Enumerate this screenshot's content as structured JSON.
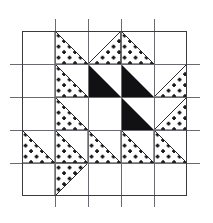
{
  "title": {
    "number": "292.",
    "name": "Fruit Basket"
  },
  "colors": {
    "ink": "#16161a",
    "dark_patch": "#111113",
    "background": "#ffffff",
    "grid_line": "#5d5d62",
    "frame_line": "#3a3a3f",
    "dot_fill": "#1a1a1d"
  },
  "block": {
    "name": "Fruit Basket",
    "grid_rows": 5,
    "grid_cols": 5,
    "cell_size_px": 33,
    "frame": {
      "x": 22,
      "y": 31,
      "width": 165,
      "height": 165
    },
    "guide_line_overhang_px": 12,
    "patch_styles": [
      "plain",
      "dotted",
      "solid-dark"
    ],
    "legend": {
      "plain_label": "plain / white patch",
      "dotted_label": "printed (dotted) patch",
      "dark_label": "solid dark patch"
    },
    "patches": [
      {
        "row": 0,
        "col": 0,
        "shape": "square",
        "fill": "plain"
      },
      {
        "row": 0,
        "col": 1,
        "shape": "triangle",
        "fill": "dotted",
        "corner": "tr"
      },
      {
        "row": 0,
        "col": 2,
        "shape": "triangle",
        "fill": "dotted",
        "corner": "tl"
      },
      {
        "row": 0,
        "col": 3,
        "shape": "triangle",
        "fill": "dotted",
        "corner": "tr"
      },
      {
        "row": 0,
        "col": 4,
        "shape": "square",
        "fill": "plain"
      },
      {
        "row": 1,
        "col": 0,
        "shape": "square",
        "fill": "plain"
      },
      {
        "row": 1,
        "col": 1,
        "shape": "triangle",
        "fill": "dotted",
        "corner": "bl"
      },
      {
        "row": 1,
        "col": 2,
        "shape": "triangle",
        "fill": "solid-dark",
        "corner": "bl"
      },
      {
        "row": 1,
        "col": 3,
        "shape": "triangle",
        "fill": "solid-dark",
        "corner": "bl"
      },
      {
        "row": 1,
        "col": 4,
        "shape": "triangle",
        "fill": "dotted",
        "corner": "tr"
      },
      {
        "row": 2,
        "col": 0,
        "shape": "square",
        "fill": "plain"
      },
      {
        "row": 2,
        "col": 1,
        "shape": "triangle",
        "fill": "dotted",
        "corner": "bl"
      },
      {
        "row": 2,
        "col": 2,
        "shape": "square",
        "fill": "plain"
      },
      {
        "row": 2,
        "col": 3,
        "shape": "triangle",
        "fill": "solid-dark",
        "corner": "br"
      },
      {
        "row": 2,
        "col": 4,
        "shape": "triangle",
        "fill": "dotted",
        "corner": "tr"
      },
      {
        "row": 3,
        "col": 0,
        "shape": "triangle",
        "fill": "dotted",
        "corner": "bl"
      },
      {
        "row": 3,
        "col": 1,
        "shape": "triangle",
        "fill": "dotted",
        "corner": "bl"
      },
      {
        "row": 3,
        "col": 2,
        "shape": "triangle",
        "fill": "dotted",
        "corner": "bl"
      },
      {
        "row": 3,
        "col": 3,
        "shape": "triangle",
        "fill": "dotted",
        "corner": "bl"
      },
      {
        "row": 3,
        "col": 4,
        "shape": "triangle",
        "fill": "dotted",
        "corner": "bl"
      },
      {
        "row": 4,
        "col": 0,
        "shape": "square",
        "fill": "plain"
      },
      {
        "row": 4,
        "col": 1,
        "shape": "triangle",
        "fill": "dotted",
        "corner": "tl"
      },
      {
        "row": 4,
        "col": 2,
        "shape": "square",
        "fill": "plain"
      },
      {
        "row": 4,
        "col": 3,
        "shape": "square",
        "fill": "plain"
      },
      {
        "row": 4,
        "col": 4,
        "shape": "square",
        "fill": "plain"
      }
    ]
  }
}
